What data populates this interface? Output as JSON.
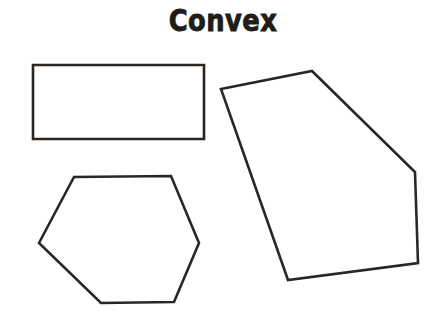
{
  "page": {
    "title": "Convex",
    "background_color": "#ffffff",
    "width": 446,
    "height": 329
  },
  "style": {
    "stroke_color": "#2b2622",
    "fill_color": "#ffffff",
    "stroke_width": 2.6,
    "text_color": "#201c18"
  },
  "shapes": [
    {
      "name": "rectangle",
      "label": "rectangle",
      "sides": 4,
      "points": "33,65 204,65 204,139 33,139"
    },
    {
      "name": "hexagon",
      "label": "hexagon",
      "sides": 6,
      "points": "39,243 74,177 171,176 199,243 174,302 101,303"
    },
    {
      "name": "pentagon",
      "label": "pentagon",
      "sides": 5,
      "points": "221,89 312,71 415,172 418,263 288,280"
    }
  ]
}
